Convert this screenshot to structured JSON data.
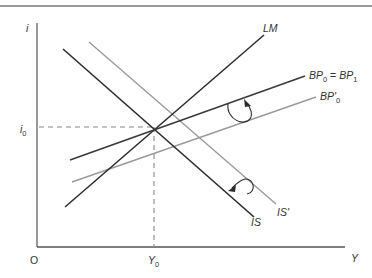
{
  "diagram": {
    "axes": {
      "y_label": "i",
      "x_label": "Y",
      "origin_label": "O",
      "i0_label_main": "i",
      "i0_label_sub": "0",
      "y0_label_main": "Y",
      "y0_label_sub": "0"
    },
    "curves": {
      "lm": {
        "label": "LM",
        "color": "#2b2b2b"
      },
      "is": {
        "label": "IS",
        "color": "#2b2b2b"
      },
      "is_prime": {
        "label": "IS'",
        "color": "#9a9a9a"
      },
      "bp0_bp1": {
        "label_a": "BP",
        "sub_a": "0",
        "eq": " = ",
        "label_b": "BP",
        "sub_b": "1",
        "color": "#3a3a3a"
      },
      "bp_prime0": {
        "label": "BP'",
        "sub": "0",
        "color": "#9a9a9a"
      }
    },
    "annotations": {
      "upper_arrow": "rotation arrow from BP'0 to BP0=BP1",
      "lower_arrow": "rotation arrow from IS' to IS"
    },
    "colors": {
      "dark_line": "#2b2b2b",
      "gray_line": "#9a9a9a",
      "axis": "#555555",
      "dashed": "#888888",
      "top_rule": "#777777"
    }
  }
}
